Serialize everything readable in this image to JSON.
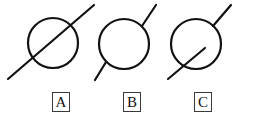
{
  "diagram": {
    "background_color": "#ffffff",
    "stroke_color": "#111111",
    "stroke_width": 2.2,
    "canvas": {
      "width": 255,
      "height": 124
    },
    "figures": [
      {
        "id": "A",
        "label": "A",
        "description": "Line passes completely through the circle as a chord, extending beyond both sides",
        "circle": {
          "cx": 53,
          "cy": 43,
          "r": 25
        },
        "line": {
          "x1": 8,
          "y1": 79,
          "x2": 94,
          "y2": 5
        },
        "line_relation": "secant-through"
      },
      {
        "id": "B",
        "label": "B",
        "description": "Line segments stop at the circle boundary on both sides; interior is empty",
        "circle": {
          "cx": 124,
          "cy": 44,
          "r": 25
        },
        "line_segments": [
          {
            "x1": 95,
            "y1": 80,
            "x2": 106,
            "y2": 62
          },
          {
            "x1": 142,
            "y1": 26,
            "x2": 156,
            "y2": 5
          }
        ],
        "line_relation": "touching-outside"
      },
      {
        "id": "C",
        "label": "C",
        "description": "Line enters the circle from the lower left and terminates near the center; outer segment continues upper right",
        "circle": {
          "cx": 196,
          "cy": 44,
          "r": 25
        },
        "line_segments": [
          {
            "x1": 168,
            "y1": 79,
            "x2": 205,
            "y2": 48
          },
          {
            "x1": 213,
            "y1": 26,
            "x2": 231,
            "y2": 5
          }
        ],
        "line_relation": "partially-inside"
      }
    ],
    "labels": {
      "box_border_color": "#3a3a3a",
      "items": [
        {
          "id": "A",
          "text": "A"
        },
        {
          "id": "B",
          "text": "B"
        },
        {
          "id": "C",
          "text": "C"
        }
      ]
    }
  }
}
